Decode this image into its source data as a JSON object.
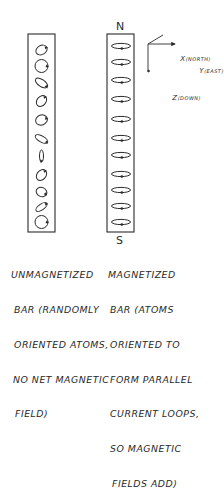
{
  "diagram": {
    "poles": {
      "north": "N",
      "south": "S"
    },
    "axes": {
      "x": {
        "letter": "X",
        "note": "(NORTH)"
      },
      "y": {
        "letter": "Y",
        "note": "(EAST)"
      },
      "z": {
        "letter": "Z",
        "note": "(DOWN)"
      }
    },
    "unmagnetized_bar": {
      "atom_count": 11,
      "atoms": [
        {
          "cy": 50,
          "rx": 6,
          "ry": 4.5,
          "rot": -30
        },
        {
          "cy": 66,
          "rx": 6.5,
          "ry": 6.5,
          "rot": 0
        },
        {
          "cy": 83,
          "rx": 7,
          "ry": 3.5,
          "rot": 35
        },
        {
          "cy": 101,
          "rx": 6,
          "ry": 4.5,
          "rot": -50
        },
        {
          "cy": 120,
          "rx": 6,
          "ry": 5,
          "rot": -20
        },
        {
          "cy": 139,
          "rx": 7,
          "ry": 3,
          "rot": 30
        },
        {
          "cy": 156,
          "rx": 6,
          "ry": 2,
          "rot": 90
        },
        {
          "cy": 175,
          "rx": 6,
          "ry": 4.5,
          "rot": -50
        },
        {
          "cy": 192,
          "rx": 5.5,
          "ry": 4.5,
          "rot": 25
        },
        {
          "cy": 207,
          "rx": 6.5,
          "ry": 3,
          "rot": -35
        },
        {
          "cy": 222,
          "rx": 6.5,
          "ry": 6.5,
          "rot": 0
        }
      ],
      "caption": [
        "UNMAGNETIZED",
        "BAR (RANDOMLY",
        "ORIENTED ATOMS,",
        "NO NET MAGNETIC",
        "FIELD)"
      ]
    },
    "magnetized_bar": {
      "atom_count": 11,
      "atoms": [
        46,
        62,
        80,
        99,
        119,
        138,
        155,
        174,
        190,
        206,
        222
      ],
      "caption": [
        "MAGNETIZED",
        "BAR (ATOMS",
        "ORIENTED TO",
        "FORM PARALLEL",
        "CURRENT LOOPS,",
        "SO MAGNETIC",
        "FIELDS ADD)"
      ]
    }
  },
  "colors": {
    "ink": "#2a2a2a",
    "background": "#ffffff"
  }
}
